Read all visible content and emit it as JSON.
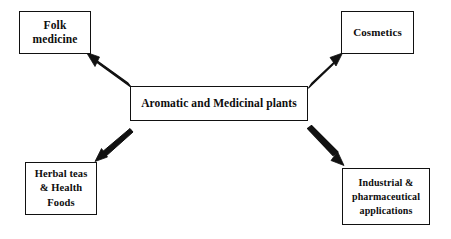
{
  "diagram": {
    "background_color": "#ffffff",
    "line_color": "#111111",
    "text_color": "#0d0d0d",
    "central_node": {
      "id": "central",
      "label": "Aromatic and Medicinal plants"
    },
    "nodes": [
      {
        "id": "folk-medicine",
        "label": "Folk\nmedicine"
      },
      {
        "id": "cosmetics",
        "label": "Cosmetics"
      },
      {
        "id": "herbal-teas",
        "label": "Herbal teas\n& Health\nFoods"
      },
      {
        "id": "industrial",
        "label": "Industrial &\npharmaceutical\napplications"
      }
    ],
    "connectors": [
      {
        "id": "arrow-to-folk-medicine",
        "from": "central",
        "to": "folk-medicine",
        "direction": "up-left"
      },
      {
        "id": "arrow-to-cosmetics",
        "from": "central",
        "to": "cosmetics",
        "direction": "up-right"
      },
      {
        "id": "arrow-to-herbal-teas",
        "from": "central",
        "to": "herbal-teas",
        "direction": "down-left"
      },
      {
        "id": "arrow-to-industrial",
        "from": "central",
        "to": "industrial",
        "direction": "down-right"
      }
    ]
  }
}
